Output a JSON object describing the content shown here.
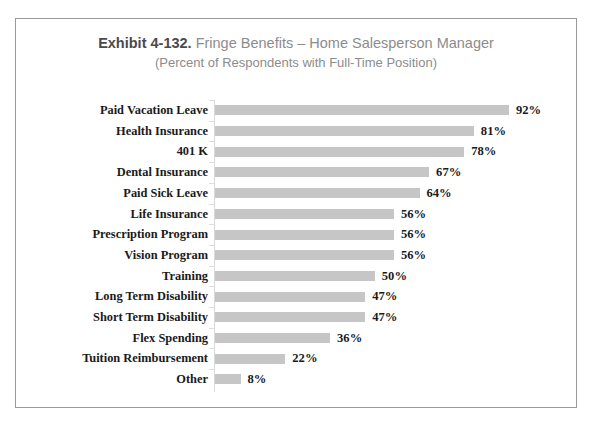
{
  "chart_data": {
    "type": "bar",
    "orientation": "horizontal",
    "title_prefix": "Exhibit 4-132.",
    "title_rest": "Fringe Benefits – Home Salesperson Manager",
    "title": "Exhibit 4-132. Fringe Benefits – Home Salesperson Manager",
    "subtitle": "(Percent of Respondents with Full-Time Position)",
    "xlabel": "",
    "ylabel": "",
    "xlim": [
      0,
      100
    ],
    "grid": false,
    "legend": false,
    "value_suffix": "%",
    "bar_color": "#c6c6c6",
    "categories": [
      "Paid Vacation Leave",
      "Health Insurance",
      "401 K",
      "Dental Insurance",
      "Paid Sick Leave",
      "Life Insurance",
      "Prescription Program",
      "Vision Program",
      "Training",
      "Long Term Disability",
      "Short Term Disability",
      "Flex Spending",
      "Tuition Reimbursement",
      "Other"
    ],
    "values": [
      92,
      81,
      78,
      67,
      64,
      56,
      56,
      56,
      50,
      47,
      47,
      36,
      22,
      8
    ],
    "value_labels": [
      "92%",
      "81%",
      "78%",
      "67%",
      "64%",
      "56%",
      "56%",
      "56%",
      "50%",
      "47%",
      "47%",
      "36%",
      "22%",
      "8%"
    ]
  }
}
